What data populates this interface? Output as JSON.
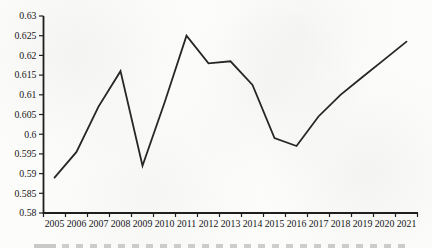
{
  "chart_data": {
    "type": "line",
    "title": "",
    "xlabel": "",
    "ylabel": "",
    "categories": [
      "2005",
      "2006",
      "2007",
      "2008",
      "2009",
      "2010",
      "2011",
      "2012",
      "2013",
      "2014",
      "2015",
      "2016",
      "2017",
      "2018",
      "2019",
      "2020",
      "2021"
    ],
    "series": [
      {
        "name": "series-1",
        "values": [
          0.589,
          0.5955,
          0.607,
          0.616,
          0.592,
          0.608,
          0.625,
          0.618,
          0.6185,
          0.6125,
          0.599,
          0.597,
          0.6045,
          0.61,
          0.6145,
          0.619,
          0.6235
        ]
      }
    ],
    "ylim": [
      0.58,
      0.63
    ],
    "ytick_step": 0.005,
    "ytick_labels": [
      "0.58",
      "0.585",
      "0.59",
      "0.595",
      "0.6",
      "0.605",
      "0.61",
      "0.615",
      "0.62",
      "0.625",
      "0.63"
    ],
    "grid": false,
    "legend_position": "none",
    "markers": false,
    "line_color": "#262626",
    "axis_color": "#1f1f1f",
    "tick_label_color": "#161616",
    "background_color": "#fcfcfb"
  }
}
